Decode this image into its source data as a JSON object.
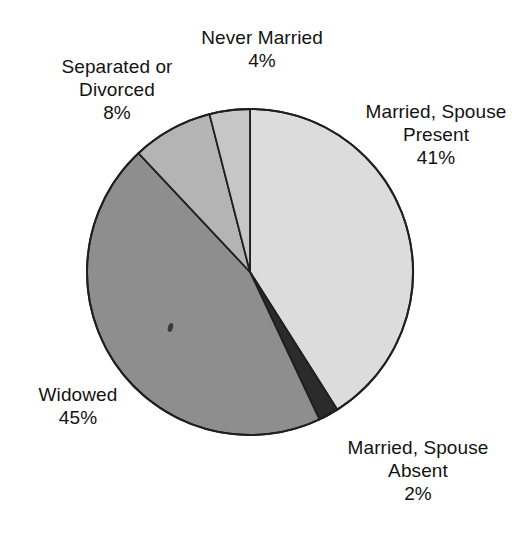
{
  "chart_data": {
    "type": "pie",
    "title": "",
    "subtitle": "",
    "xlabel": "",
    "ylabel": "",
    "legend_position": "none",
    "grid": false,
    "start_angle_deg": 0,
    "direction": "clockwise",
    "center": {
      "x": 250,
      "y": 272
    },
    "radius": 163,
    "categories": [
      "Married, Spouse Present",
      "Married, Spouse Absent",
      "Widowed",
      "Separated or Divorced",
      "Never Married"
    ],
    "values": [
      41,
      2,
      45,
      8,
      4
    ],
    "value_unit": "%",
    "colors": [
      "#dcdcdc",
      "#2b2b2b",
      "#8e8e8e",
      "#b4b4b4",
      "#c6c6c6"
    ],
    "stroke_color": "#1f1f1f",
    "slices": [
      {
        "id": "married-spouse-present",
        "name_lines": [
          "Married, Spouse",
          "Present"
        ],
        "value_label": "41%",
        "value": 41,
        "color": "#dcdcdc"
      },
      {
        "id": "married-spouse-absent",
        "name_lines": [
          "Married, Spouse",
          "Absent"
        ],
        "value_label": "2%",
        "value": 2,
        "color": "#2b2b2b"
      },
      {
        "id": "widowed",
        "name_lines": [
          "Widowed"
        ],
        "value_label": "45%",
        "value": 45,
        "color": "#8e8e8e"
      },
      {
        "id": "separated-or-divorced",
        "name_lines": [
          "Separated or",
          "Divorced"
        ],
        "value_label": "8%",
        "value": 8,
        "color": "#b4b4b4"
      },
      {
        "id": "never-married",
        "name_lines": [
          "Never Married"
        ],
        "value_label": "4%",
        "value": 4,
        "color": "#c6c6c6"
      }
    ]
  },
  "labels": {
    "never_married": {
      "line1": "Never Married",
      "value": "4%"
    },
    "separated_or_divorced": {
      "line1": "Separated or",
      "line2": "Divorced",
      "value": "8%"
    },
    "married_spouse_present": {
      "line1": "Married, Spouse",
      "line2": "Present",
      "value": "41%"
    },
    "widowed": {
      "line1": "Widowed",
      "value": "45%"
    },
    "married_spouse_absent": {
      "line1": "Married, Spouse",
      "line2": "Absent",
      "value": "2%"
    }
  }
}
